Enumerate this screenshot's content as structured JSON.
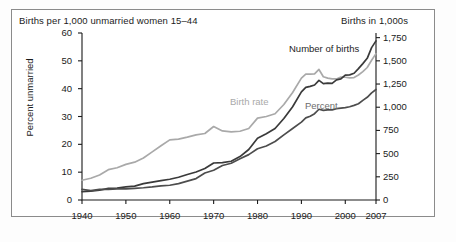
{
  "figure": {
    "header_left": "Births per 1,000 unmarried women 15–44",
    "header_right": "Births in 1,000s"
  },
  "chart_data": {
    "type": "line",
    "title": "",
    "xlabel": "",
    "ylabel": "Percent unmarried",
    "ylabel_right": "Births in 1,000s",
    "grid": false,
    "legend": "inline-annotations",
    "xlim": [
      1940,
      2007
    ],
    "ylim": [
      0,
      60
    ],
    "ylim_right": [
      0,
      1800
    ],
    "xticks": [
      1940,
      1950,
      1960,
      1970,
      1980,
      1990,
      2000,
      2007
    ],
    "xticklabels": [
      "1940",
      "1950",
      "1960",
      "1970",
      "1980",
      "1990",
      "2000",
      "2007"
    ],
    "yticks_left": [
      0,
      10,
      20,
      30,
      40,
      50,
      60
    ],
    "yticklabels_left": [
      "0",
      "10",
      "20",
      "30",
      "40",
      "50",
      "60"
    ],
    "yticks_right": [
      0,
      250,
      500,
      750,
      1000,
      1250,
      1500,
      1750
    ],
    "yticklabels_right": [
      "0",
      "250",
      "500",
      "750",
      "1,000",
      "1,250",
      "1,500",
      "1,750"
    ],
    "annotations": [
      {
        "text": "Number of births",
        "color": "#1d1d1d"
      },
      {
        "text": "Birth rate",
        "color": "#a9a9a9"
      },
      {
        "text": "Percent",
        "color": "#6d6d6d"
      }
    ],
    "x": [
      1940,
      1942,
      1944,
      1946,
      1948,
      1950,
      1952,
      1954,
      1956,
      1958,
      1960,
      1962,
      1964,
      1966,
      1968,
      1970,
      1972,
      1974,
      1976,
      1978,
      1980,
      1982,
      1984,
      1986,
      1988,
      1990,
      1991,
      1992,
      1993,
      1994,
      1995,
      1996,
      1997,
      1998,
      1999,
      2000,
      2001,
      2002,
      2003,
      2004,
      2005,
      2006,
      2007
    ],
    "series": [
      {
        "name": "Birth rate",
        "axis": "left",
        "units": "births per 1,000 unmarried women 15-44",
        "color": "#a9a9a9",
        "values": [
          7.1,
          7.8,
          9.0,
          10.9,
          11.6,
          12.8,
          13.6,
          15.1,
          17.3,
          19.5,
          21.6,
          21.9,
          22.6,
          23.4,
          23.9,
          26.4,
          24.8,
          24.5,
          24.7,
          25.7,
          29.4,
          30.0,
          31.0,
          34.3,
          38.6,
          43.8,
          45.2,
          45.2,
          45.3,
          46.9,
          44.3,
          43.8,
          43.5,
          43.5,
          44.2,
          44.1,
          43.9,
          44.0,
          44.9,
          46.1,
          47.6,
          50.2,
          52.6
        ]
      },
      {
        "name": "Number of births",
        "axis": "right",
        "units": "births in 1,000s",
        "color": "#3a3a3a",
        "values": [
          89,
          95,
          105,
          125,
          129,
          142,
          150,
          176,
          193,
          208,
          224,
          245,
          275,
          302,
          339,
          399,
          403,
          418,
          468,
          544,
          666,
          715,
          770,
          878,
          1005,
          1165,
          1214,
          1225,
          1240,
          1290,
          1254,
          1260,
          1257,
          1294,
          1305,
          1347,
          1349,
          1366,
          1416,
          1470,
          1527,
          1642,
          1715
        ]
      },
      {
        "name": "Percent",
        "axis": "left",
        "units": "percent of births to unmarried women",
        "color": "#4d4d4d",
        "values": [
          3.8,
          3.4,
          3.8,
          3.8,
          4.0,
          4.0,
          4.2,
          4.4,
          4.7,
          5.1,
          5.3,
          5.9,
          6.8,
          7.7,
          9.7,
          10.7,
          12.4,
          13.2,
          14.8,
          16.3,
          18.4,
          19.4,
          21.0,
          23.4,
          25.7,
          28.0,
          29.5,
          30.1,
          31.0,
          32.6,
          32.2,
          32.4,
          32.4,
          32.8,
          33.0,
          33.2,
          33.5,
          34.0,
          34.6,
          35.8,
          36.9,
          38.5,
          39.7
        ]
      }
    ]
  }
}
